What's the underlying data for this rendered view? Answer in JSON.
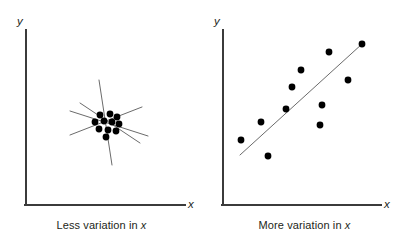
{
  "figure": {
    "background": "#ffffff",
    "axis_color": "#3b3b3b",
    "dot_color": "#000000",
    "line_color": "#6b6b6b",
    "width": 406,
    "height": 247
  },
  "panels": [
    {
      "id": "less-variation",
      "caption_prefix": "Less variation in ",
      "caption_variable": "x",
      "y_axis_label": "y",
      "x_axis_label": "x"
    },
    {
      "id": "more-variation",
      "caption_prefix": "More variation in ",
      "caption_variable": "x",
      "y_axis_label": "y",
      "x_axis_label": "x"
    }
  ],
  "chart_data": [
    {
      "type": "scatter",
      "title": "Less variation in x",
      "xlabel": "x",
      "ylabel": "y",
      "xlim": [
        0,
        203
      ],
      "ylim": [
        0,
        205
      ],
      "grid": false,
      "legend": false,
      "note": "Tight cluster of points with several candidate regression lines of widely differing slopes drawn through it",
      "points": [
        {
          "x": 100,
          "y": 115
        },
        {
          "x": 110,
          "y": 114
        },
        {
          "x": 117,
          "y": 117
        },
        {
          "x": 95,
          "y": 122
        },
        {
          "x": 104,
          "y": 121
        },
        {
          "x": 112,
          "y": 122
        },
        {
          "x": 119,
          "y": 124
        },
        {
          "x": 99,
          "y": 129
        },
        {
          "x": 108,
          "y": 130
        },
        {
          "x": 116,
          "y": 131
        },
        {
          "x": 106,
          "y": 137
        }
      ],
      "candidate_lines": [
        {
          "x1": 99,
          "y1": 80,
          "x2": 112,
          "y2": 165,
          "label": "steep-line"
        },
        {
          "x1": 70,
          "y1": 111,
          "x2": 148,
          "y2": 136,
          "label": "shallow-up-line"
        },
        {
          "x1": 70,
          "y1": 135,
          "x2": 142,
          "y2": 107,
          "label": "shallow-down-line"
        },
        {
          "x1": 80,
          "y1": 103,
          "x2": 140,
          "y2": 143,
          "label": "diagonal-line"
        }
      ]
    },
    {
      "type": "scatter",
      "title": "More variation in x",
      "xlabel": "x",
      "ylabel": "y",
      "xlim": [
        0,
        203
      ],
      "ylim": [
        0,
        205
      ],
      "grid": false,
      "legend": false,
      "note": "Points spread widely over x with a single well-determined rising regression line",
      "points": [
        {
          "x": 38,
          "y": 140
        },
        {
          "x": 58,
          "y": 122
        },
        {
          "x": 65,
          "y": 156
        },
        {
          "x": 83,
          "y": 109
        },
        {
          "x": 89,
          "y": 87
        },
        {
          "x": 98,
          "y": 70
        },
        {
          "x": 117,
          "y": 125
        },
        {
          "x": 119,
          "y": 105
        },
        {
          "x": 126,
          "y": 52
        },
        {
          "x": 145,
          "y": 80
        },
        {
          "x": 159,
          "y": 44
        }
      ],
      "trend_line": {
        "x1": 37,
        "y1": 155,
        "x2": 159,
        "y2": 44
      }
    }
  ]
}
